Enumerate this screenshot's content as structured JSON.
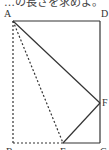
{
  "caption": "…の長さを求めよ。",
  "figure": {
    "points": {
      "A": {
        "label": "A",
        "x": 13,
        "y": 21
      },
      "D": {
        "label": "D",
        "x": 100,
        "y": 21
      },
      "B": {
        "label": "B",
        "x": 13,
        "y": 143
      },
      "C": {
        "label": "C",
        "x": 100,
        "y": 143
      },
      "E": {
        "label": "E",
        "x": 63,
        "y": 143
      },
      "F": {
        "label": "F",
        "x": 100,
        "y": 103
      }
    },
    "solid_segments": [
      "AD",
      "DC",
      "AF",
      "FE",
      "EC"
    ],
    "dashed_segments": [
      "AB",
      "BE",
      "AE"
    ],
    "line_color": "#333333"
  }
}
